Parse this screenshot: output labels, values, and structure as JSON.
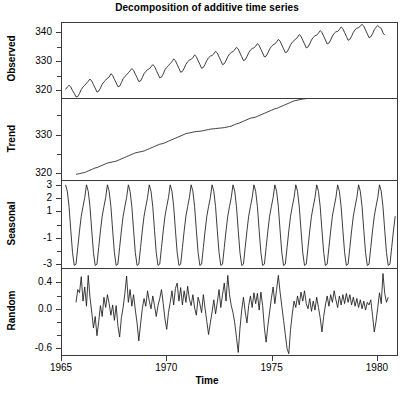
{
  "chart_data": {
    "type": "line",
    "title": "Decomposition of additive time series",
    "xlabel": "Time",
    "ylabel": "",
    "grid": false,
    "legend": null,
    "xlim": [
      1965.0,
      1981.0
    ],
    "xticks": [
      1965,
      1970,
      1975,
      1980
    ],
    "xtick_labels": [
      "1965",
      "1970",
      "1975",
      "1980"
    ],
    "panels": [
      {
        "name": "observed",
        "ylabel": "Observed",
        "ylim": [
          317.0,
          343.5
        ],
        "yticks": [
          320,
          330,
          340
        ],
        "ytick_labels": [
          "320",
          "330",
          "340"
        ],
        "yminor": [
          325,
          335
        ],
        "x_start": 1965.17,
        "x_end": 1980.92,
        "x_step": 0.0833,
        "values": [
          320.0,
          320.9,
          321.5,
          320.9,
          319.6,
          318.6,
          317.4,
          317.5,
          318.6,
          320.0,
          320.9,
          321.5,
          322.2,
          322.9,
          323.7,
          323.0,
          321.7,
          320.5,
          319.1,
          319.4,
          320.5,
          321.9,
          322.7,
          323.3,
          324.0,
          324.4,
          325.6,
          325.0,
          323.6,
          322.4,
          321.0,
          321.2,
          322.4,
          323.8,
          324.6,
          325.2,
          325.9,
          326.6,
          327.4,
          326.8,
          325.4,
          324.2,
          322.8,
          323.0,
          324.2,
          325.6,
          326.4,
          327.0,
          327.3,
          328.0,
          328.8,
          328.2,
          326.8,
          325.5,
          324.1,
          324.4,
          325.5,
          327.0,
          327.8,
          328.4,
          329.2,
          329.8,
          330.8,
          330.2,
          328.8,
          327.5,
          326.1,
          326.4,
          327.5,
          328.9,
          329.8,
          330.4,
          330.6,
          331.3,
          332.2,
          331.6,
          330.2,
          328.9,
          327.5,
          327.8,
          328.9,
          330.3,
          331.2,
          331.8,
          332.0,
          332.6,
          333.5,
          332.9,
          331.5,
          330.2,
          328.8,
          329.1,
          330.2,
          331.6,
          332.5,
          333.1,
          333.4,
          334.0,
          334.9,
          334.3,
          332.9,
          331.6,
          330.2,
          330.5,
          331.6,
          333.0,
          333.9,
          334.5,
          334.7,
          335.3,
          336.2,
          335.6,
          334.2,
          332.9,
          331.5,
          331.8,
          332.9,
          334.3,
          335.2,
          335.8,
          336.1,
          336.8,
          337.7,
          337.1,
          335.7,
          334.4,
          333.0,
          333.3,
          334.4,
          335.8,
          336.7,
          337.3,
          337.8,
          338.5,
          339.4,
          338.8,
          337.4,
          336.1,
          334.7,
          335.0,
          336.1,
          337.5,
          338.4,
          339.0,
          339.2,
          339.9,
          340.8,
          340.2,
          338.8,
          337.5,
          336.1,
          336.4,
          337.5,
          338.9,
          339.8,
          340.4,
          340.5,
          341.2,
          342.1,
          341.5,
          340.1,
          338.8,
          337.4,
          337.7,
          338.8,
          340.2,
          341.1,
          341.7,
          341.8,
          342.5,
          343.0,
          342.4,
          341.0,
          339.7,
          338.3,
          338.6,
          339.7,
          341.1,
          342.0,
          342.6,
          342.0,
          341.6,
          340.0,
          339.2
        ]
      },
      {
        "name": "trend",
        "ylabel": "Trend",
        "ylim": [
          318.0,
          339.5
        ],
        "yticks": [
          320,
          330
        ],
        "ytick_labels": [
          "320",
          "330"
        ],
        "yminor": [
          325,
          335
        ],
        "x_start": 1965.67,
        "x_end": 1980.42,
        "x_step": 0.0833,
        "values": [
          319.5,
          319.6,
          319.7,
          319.8,
          319.9,
          320.0,
          320.2,
          320.4,
          320.6,
          320.8,
          321.0,
          321.2,
          321.3,
          321.5,
          321.7,
          321.9,
          322.1,
          322.3,
          322.5,
          322.6,
          322.7,
          322.8,
          322.9,
          323.0,
          323.2,
          323.4,
          323.6,
          323.8,
          324.0,
          324.2,
          324.4,
          324.6,
          324.8,
          325.0,
          325.2,
          325.3,
          325.4,
          325.5,
          325.6,
          325.7,
          325.9,
          326.1,
          326.3,
          326.5,
          326.7,
          326.9,
          327.1,
          327.3,
          327.5,
          327.6,
          327.7,
          327.9,
          328.1,
          328.3,
          328.5,
          328.7,
          328.9,
          329.1,
          329.3,
          329.5,
          329.7,
          329.9,
          330.1,
          330.3,
          330.4,
          330.5,
          330.6,
          330.7,
          330.8,
          330.85,
          330.9,
          330.95,
          331.0,
          331.1,
          331.2,
          331.3,
          331.4,
          331.5,
          331.55,
          331.6,
          331.65,
          331.7,
          331.75,
          331.8,
          331.85,
          331.9,
          332.0,
          332.1,
          332.2,
          332.3,
          332.5,
          332.7,
          332.9,
          333.0,
          333.2,
          333.4,
          333.6,
          333.8,
          334.0,
          334.2,
          334.4,
          334.5,
          334.6,
          334.7,
          334.9,
          335.1,
          335.3,
          335.5,
          335.7,
          335.9,
          336.1,
          336.3,
          336.5,
          336.7,
          336.9,
          337.0,
          337.2,
          337.4,
          337.6,
          337.8,
          338.0,
          338.2,
          338.4,
          338.6,
          338.8,
          339.0,
          339.1,
          339.2,
          339.3,
          339.4,
          339.5,
          339.55,
          339.6,
          339.65,
          339.7,
          339.75,
          339.8,
          339.85,
          339.9,
          339.95,
          340.0,
          340.05,
          340.1,
          340.15,
          340.2,
          340.25,
          340.3,
          340.35,
          340.4,
          340.45,
          340.5,
          340.55,
          340.6,
          340.65,
          340.7,
          340.75,
          340.8,
          340.85,
          340.9,
          340.95,
          341.0,
          341.05,
          341.1,
          341.15,
          341.2,
          341.25,
          341.3,
          341.35,
          341.4,
          341.45,
          341.5,
          341.55,
          341.6
        ]
      },
      {
        "name": "seasonal",
        "ylabel": "Seasonal",
        "ylim": [
          -3.4,
          3.4
        ],
        "yticks": [
          3,
          2,
          1,
          -1,
          -3
        ],
        "ytick_labels": [
          "3",
          "2",
          "1",
          "-1",
          "-3"
        ],
        "yminor": [
          0,
          -2
        ],
        "x_start": 1965.17,
        "x_end": 1980.92,
        "x_step": 0.0833,
        "cycle": [
          0.65,
          1.4,
          2.1,
          3.1,
          2.6,
          1.4,
          -0.45,
          -2.2,
          -3.2,
          -3.1,
          -1.8,
          -0.5
        ],
        "cycle_start_month": 3,
        "peak_value": 3.1,
        "trough_value": -3.2,
        "cycles_shown": 16
      },
      {
        "name": "random",
        "ylabel": "Random",
        "ylim": [
          -0.72,
          0.62
        ],
        "yticks": [
          0.4,
          0.0,
          -0.6
        ],
        "ytick_labels": [
          "0.4",
          "0.0",
          "-0.6"
        ],
        "yminor": [
          0.2,
          -0.2,
          -0.4
        ],
        "x_start": 1965.67,
        "x_end": 1980.42,
        "x_step": 0.0833,
        "values": [
          0.1,
          0.3,
          0.25,
          0.5,
          0.12,
          0.34,
          0.04,
          0.52,
          0.18,
          -0.05,
          -0.3,
          -0.12,
          -0.42,
          -0.2,
          0.05,
          -0.12,
          0.18,
          0.02,
          0.22,
          0.08,
          -0.1,
          0.06,
          -0.18,
          0.05,
          -0.26,
          -0.44,
          -0.14,
          0.02,
          0.24,
          0.51,
          0.1,
          0.3,
          0.04,
          0.22,
          -0.02,
          -0.22,
          -0.5,
          -0.24,
          0.0,
          0.16,
          0.04,
          0.28,
          0.12,
          0.0,
          0.2,
          0.05,
          -0.12,
          0.05,
          0.16,
          0.3,
          0.08,
          -0.16,
          -0.32,
          -0.06,
          0.1,
          0.28,
          0.06,
          0.32,
          0.4,
          0.12,
          0.33,
          0.06,
          0.28,
          0.1,
          0.35,
          0.15,
          0.05,
          0.22,
          0.01,
          -0.1,
          0.18,
          0.08,
          -0.06,
          0.22,
          0.0,
          -0.2,
          -0.4,
          -0.22,
          -0.05,
          0.14,
          -0.08,
          0.1,
          0.3,
          0.02,
          0.22,
          0.4,
          0.12,
          0.52,
          0.22,
          0.05,
          -0.06,
          -0.22,
          -0.45,
          -0.68,
          -0.3,
          -0.02,
          0.18,
          -0.05,
          -0.22,
          0.05,
          0.2,
          0.02,
          0.25,
          0.08,
          0.24,
          -0.02,
          0.26,
          0.05,
          -0.3,
          -0.52,
          -0.26,
          -0.05,
          0.16,
          0.34,
          0.08,
          0.3,
          0.52,
          0.26,
          0.04,
          -0.18,
          -0.4,
          -0.62,
          -0.7,
          -0.32,
          -0.08,
          0.12,
          0.02,
          0.2,
          0.06,
          0.26,
          0.12,
          0.28,
          0.08,
          0.0,
          0.16,
          -0.04,
          0.12,
          -0.02,
          0.18,
          0.02,
          -0.14,
          -0.36,
          -0.12,
          0.06,
          0.2,
          0.04,
          0.22,
          0.1,
          0.28,
          0.14,
          0.02,
          0.2,
          0.06,
          0.22,
          0.08,
          0.24,
          0.1,
          0.22,
          0.06,
          0.18,
          0.04,
          0.16,
          0.02,
          0.14,
          0.0,
          0.12,
          -0.02,
          0.1,
          0.06,
          0.14,
          -0.1,
          -0.36,
          -0.2,
          0.02,
          0.25,
          0.08,
          0.55,
          0.24,
          0.1,
          0.18
        ]
      }
    ]
  }
}
